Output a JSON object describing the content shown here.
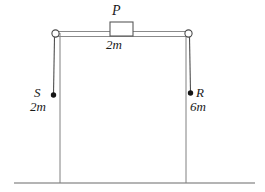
{
  "figure": {
    "background_color": "#ffffff",
    "line_color": "#555555",
    "dark_line_color": "#2b2b2b",
    "text_color": "#1a1a1a"
  },
  "labels": {
    "block_name": "P",
    "block_mass": "2m",
    "left_mass_name": "S",
    "left_mass_value": "2m",
    "right_mass_name": "R",
    "right_mass_value": "6m"
  },
  "elements": {
    "ground_line": "ground-line",
    "left_post": "left-vertical-post",
    "right_post": "right-vertical-post",
    "top_beam": "top-horizontal-beam",
    "left_pulley": "left-pulley-ring",
    "right_pulley": "right-pulley-ring",
    "block": "block-p",
    "left_string": "left-hanging-string",
    "right_string": "right-hanging-string",
    "left_bob": "left-mass-dot",
    "right_bob": "right-mass-dot"
  },
  "geometry": {
    "canvas_width": 265,
    "canvas_height": 192,
    "ground_y": 183,
    "beam_y": 34,
    "left_x": 55,
    "right_x": 188,
    "block_left": 110,
    "block_right": 133,
    "block_top": 22,
    "left_bob_y": 95,
    "right_bob_y": 93
  }
}
